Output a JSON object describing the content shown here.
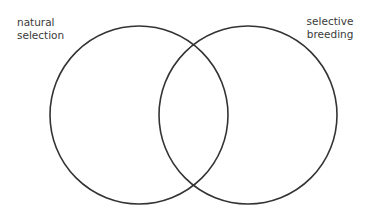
{
  "diagram": {
    "type": "venn",
    "sets": [
      {
        "label_line1": "natural",
        "label_line2": "selection",
        "cx": 139,
        "cy": 115,
        "r": 89
      },
      {
        "label_line1": "selective",
        "label_line2": "breeding",
        "cx": 248,
        "cy": 115,
        "r": 89
      }
    ],
    "stroke_color": "#333333",
    "stroke_width": 1.6
  }
}
